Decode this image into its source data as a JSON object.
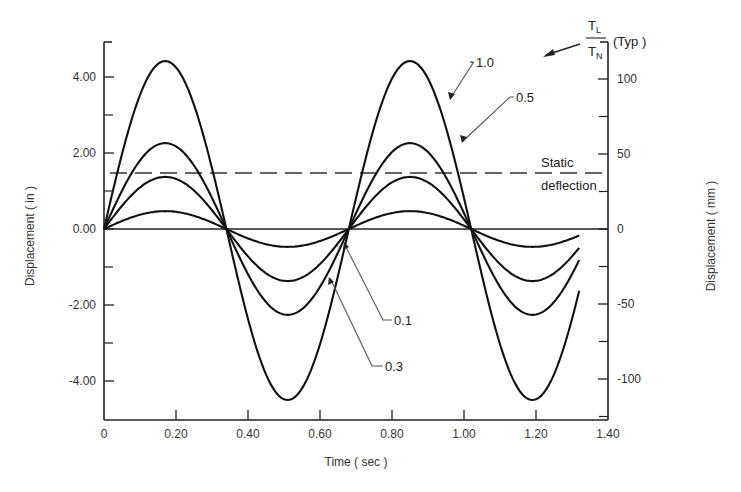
{
  "chart_data": {
    "type": "line",
    "title": "",
    "xlabel": "Time ( sec )",
    "ylabel": "Displacement ( in )",
    "ylabel_right": "Displacement ( mm )",
    "xlim": [
      0,
      1.4
    ],
    "ylim": [
      -5.0,
      4.9
    ],
    "grid": false,
    "x_ticks": [
      {
        "value": 0,
        "label": "0"
      },
      {
        "value": 0.2,
        "label": "0.20"
      },
      {
        "value": 0.4,
        "label": "0.40"
      },
      {
        "value": 0.6,
        "label": "0.60"
      },
      {
        "value": 0.8,
        "label": "0.80"
      },
      {
        "value": 1.0,
        "label": "1.00"
      },
      {
        "value": 1.2,
        "label": "1.20"
      },
      {
        "value": 1.4,
        "label": "1.40"
      }
    ],
    "y_ticks": [
      {
        "value": 4,
        "label": "4.00"
      },
      {
        "value": 2,
        "label": "2.00"
      },
      {
        "value": 0,
        "label": "0.00"
      },
      {
        "value": -2,
        "label": "-2.00"
      },
      {
        "value": -4,
        "label": "-4.00"
      }
    ],
    "y_minor_ticks": [
      3,
      1,
      -1,
      -3
    ],
    "y_right_ticks": [
      {
        "value_mm": 100,
        "label": "100"
      },
      {
        "value_mm": 50,
        "label": "50"
      },
      {
        "value_mm": 0,
        "label": "0"
      },
      {
        "value_mm": -50,
        "label": "-50"
      },
      {
        "value_mm": -100,
        "label": "-100"
      }
    ],
    "y_right_minor_ticks_mm": [
      125,
      75,
      25,
      -25,
      -75,
      -125
    ],
    "period_sec": 0.68,
    "x_end": 1.32,
    "series": [
      {
        "name": "T_L/T_N = 1.0",
        "label": "1.0",
        "amplitude": 4.42,
        "x": [
          0,
          0.17,
          0.34,
          0.51,
          0.68,
          0.85,
          1.02,
          1.19,
          1.32
        ],
        "values": [
          0,
          4.42,
          0,
          -4.5,
          0,
          4.42,
          0,
          -4.5,
          -2.1
        ]
      },
      {
        "name": "T_L/T_N = 0.5",
        "label": "0.5",
        "amplitude": 2.26,
        "x": [
          0,
          0.17,
          0.34,
          0.51,
          0.68,
          0.85,
          1.02,
          1.19,
          1.32
        ],
        "values": [
          0,
          2.26,
          0,
          -2.26,
          0,
          2.26,
          0,
          -2.26,
          -0.9
        ]
      },
      {
        "name": "T_L/T_N = 0.3",
        "label": "0.3",
        "amplitude": 1.37,
        "x": [
          0,
          0.17,
          0.34,
          0.51,
          0.68,
          0.85,
          1.02,
          1.19,
          1.32
        ],
        "values": [
          0,
          1.37,
          0,
          -1.37,
          0,
          1.37,
          0,
          -1.37,
          -0.55
        ]
      },
      {
        "name": "T_L/T_N = 0.1",
        "label": "0.1",
        "amplitude": 0.47,
        "x": [
          0,
          0.17,
          0.34,
          0.51,
          0.68,
          0.85,
          1.02,
          1.19,
          1.32
        ],
        "values": [
          0,
          0.47,
          0,
          -0.47,
          0,
          0.47,
          0,
          -0.47,
          -0.19
        ]
      }
    ],
    "reference_lines": [
      {
        "name": "Static deflection",
        "y": 1.47,
        "style": "dashed",
        "label_line1": "Static",
        "label_line2": "deflection"
      }
    ],
    "annotations": [
      {
        "text": "1.0",
        "target_series": "T_L/T_N = 1.0"
      },
      {
        "text": "0.5",
        "target_series": "T_L/T_N = 0.5"
      },
      {
        "text": "0.1",
        "target_series": "T_L/T_N = 0.1"
      },
      {
        "text": "0.3",
        "target_series": "T_L/T_N = 0.3"
      },
      {
        "text": "T_L / T_N (Typ)",
        "numerator": "T",
        "numerator_sub": "L",
        "denominator": "T",
        "denominator_sub": "N",
        "suffix": "(Typ )"
      }
    ],
    "legend": "none (inline labels)"
  },
  "labels": {
    "xlabel": "Time ( sec )",
    "ylabel_left": "Displacement ( in )",
    "ylabel_right": "Displacement ( mm )",
    "static_line1": "Static",
    "static_line2": "deflection",
    "label_10": "1.0",
    "label_05": "0.5",
    "label_01": "0.1",
    "label_03": "0.3",
    "ratio_num": "T",
    "ratio_num_sub": "L",
    "ratio_den": "T",
    "ratio_den_sub": "N",
    "ratio_suffix": "(Typ )"
  },
  "colors": {
    "line": "#111111",
    "axis": "#222222",
    "leader": "#555555",
    "background": "#ffffff"
  }
}
